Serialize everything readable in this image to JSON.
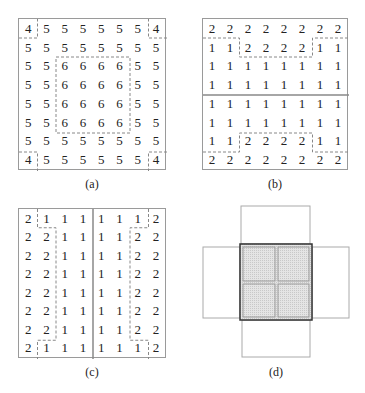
{
  "captions": {
    "a": "(a)",
    "b": "(b)",
    "c": "(c)",
    "d": "(d)"
  },
  "panel_a": {
    "rows": [
      [
        "4",
        "5",
        "5",
        "5",
        "5",
        "5",
        "5",
        "4"
      ],
      [
        "5",
        "5",
        "5",
        "5",
        "5",
        "5",
        "5",
        "5"
      ],
      [
        "5",
        "5",
        "6",
        "6",
        "6",
        "6",
        "5",
        "5"
      ],
      [
        "5",
        "5",
        "6",
        "6",
        "6",
        "6",
        "5",
        "5"
      ],
      [
        "5",
        "5",
        "6",
        "6",
        "6",
        "6",
        "5",
        "5"
      ],
      [
        "5",
        "5",
        "6",
        "6",
        "6",
        "6",
        "5",
        "5"
      ],
      [
        "5",
        "5",
        "5",
        "5",
        "5",
        "5",
        "5",
        "5"
      ],
      [
        "4",
        "5",
        "5",
        "5",
        "5",
        "5",
        "5",
        "4"
      ]
    ]
  },
  "panel_b": {
    "rows": [
      [
        "2",
        "2",
        "2",
        "2",
        "2",
        "2",
        "2",
        "2"
      ],
      [
        "1",
        "1",
        "2",
        "2",
        "2",
        "2",
        "1",
        "1"
      ],
      [
        "1",
        "1",
        "1",
        "1",
        "1",
        "1",
        "1",
        "1"
      ],
      [
        "1",
        "1",
        "1",
        "1",
        "1",
        "1",
        "1",
        "1"
      ],
      [
        "1",
        "1",
        "1",
        "1",
        "1",
        "1",
        "1",
        "1"
      ],
      [
        "1",
        "1",
        "1",
        "1",
        "1",
        "1",
        "1",
        "1"
      ],
      [
        "1",
        "1",
        "2",
        "2",
        "2",
        "2",
        "1",
        "1"
      ],
      [
        "2",
        "2",
        "2",
        "2",
        "2",
        "2",
        "2",
        "2"
      ]
    ]
  },
  "panel_c": {
    "rows": [
      [
        "2",
        "1",
        "1",
        "1",
        "1",
        "1",
        "1",
        "2"
      ],
      [
        "2",
        "2",
        "1",
        "1",
        "1",
        "1",
        "2",
        "2"
      ],
      [
        "2",
        "2",
        "1",
        "1",
        "1",
        "1",
        "2",
        "2"
      ],
      [
        "2",
        "2",
        "1",
        "1",
        "1",
        "1",
        "2",
        "2"
      ],
      [
        "2",
        "2",
        "1",
        "1",
        "1",
        "1",
        "2",
        "2"
      ],
      [
        "2",
        "2",
        "1",
        "1",
        "1",
        "1",
        "2",
        "2"
      ],
      [
        "2",
        "2",
        "1",
        "1",
        "1",
        "1",
        "2",
        "2"
      ],
      [
        "2",
        "1",
        "1",
        "1",
        "1",
        "1",
        "1",
        "2"
      ]
    ]
  },
  "colors": {
    "border": "#9a9a9a",
    "dashed": "#888888",
    "shade": "#d9d9d9",
    "dark_border": "#333333"
  }
}
